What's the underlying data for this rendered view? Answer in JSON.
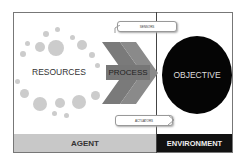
{
  "diagram": {
    "nodes": {
      "resources": "RESOURCES",
      "process": "PROCESS",
      "objective": "OBJECTIVE"
    },
    "callouts": {
      "sensors": "SENSORS",
      "actuators": "ACTUATORS"
    },
    "footer": {
      "agent": "AGENT",
      "environment": "ENVIRONMENT"
    },
    "colors": {
      "agent_bar": "#c8c8c8",
      "environment_bar": "#111111",
      "objective_circle": "#050505",
      "process_chevron": "#777777",
      "resource_dots": "#cccccc"
    }
  }
}
